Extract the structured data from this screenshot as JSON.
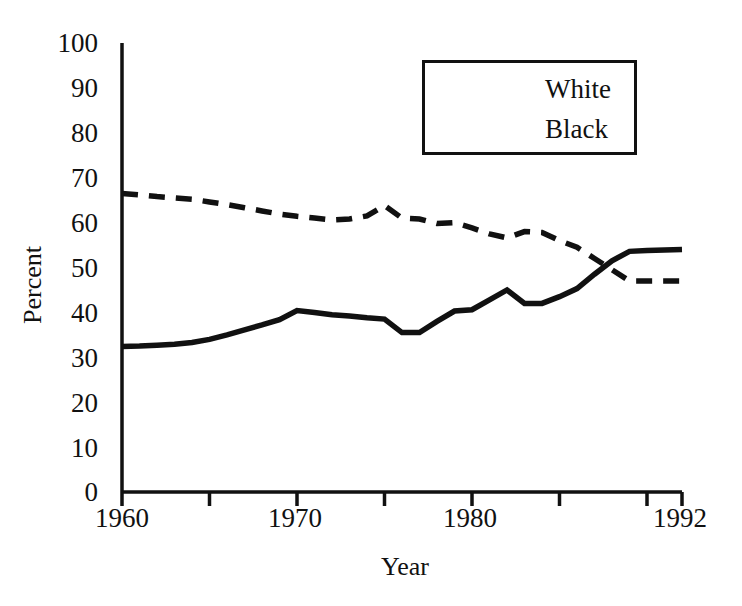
{
  "chart_data": {
    "type": "line",
    "title": "",
    "xlabel": "Year",
    "ylabel": "Percent",
    "xlim": [
      1960,
      1992
    ],
    "ylim": [
      0,
      100
    ],
    "grid": false,
    "legend_position": "top-right",
    "x_ticks_labeled": [
      "1960",
      "1970",
      "1980",
      "1992"
    ],
    "x_tick_values_labeled": [
      1960,
      1970,
      1980,
      1992
    ],
    "x_ticks_minor": [
      1965,
      1975,
      1985,
      1990
    ],
    "y_ticks": [
      "0",
      "10",
      "20",
      "30",
      "40",
      "50",
      "60",
      "70",
      "80",
      "90",
      "100"
    ],
    "y_tick_values": [
      0,
      10,
      20,
      30,
      40,
      50,
      60,
      70,
      80,
      90,
      100
    ],
    "x": [
      1960,
      1961,
      1962,
      1963,
      1964,
      1965,
      1966,
      1967,
      1968,
      1969,
      1970,
      1971,
      1972,
      1973,
      1974,
      1975,
      1976,
      1977,
      1978,
      1979,
      1980,
      1981,
      1982,
      1983,
      1984,
      1985,
      1986,
      1987,
      1988,
      1989,
      1990,
      1991,
      1992
    ],
    "series": [
      {
        "name": "White",
        "style": "dashed",
        "color": "#111111",
        "values": [
          66.5,
          66.2,
          65.8,
          65.5,
          65.2,
          64.6,
          64.0,
          63.3,
          62.6,
          61.9,
          61.4,
          61.0,
          60.6,
          60.8,
          61.5,
          63.8,
          61.0,
          60.8,
          59.8,
          60.0,
          58.8,
          57.5,
          56.6,
          58.0,
          57.8,
          56.0,
          54.5,
          52.0,
          49.5,
          47.0,
          47.0,
          47.0,
          47.0
        ]
      },
      {
        "name": "Black",
        "style": "solid",
        "color": "#111111",
        "values": [
          32.4,
          32.5,
          32.7,
          32.9,
          33.3,
          34.0,
          35.0,
          36.1,
          37.2,
          38.4,
          40.4,
          40.0,
          39.5,
          39.2,
          38.8,
          38.5,
          35.5,
          35.5,
          38.0,
          40.3,
          40.6,
          42.8,
          45.0,
          42.0,
          42.0,
          43.5,
          45.3,
          48.5,
          51.5,
          53.6,
          53.8,
          53.9,
          54.0
        ]
      }
    ],
    "notes": {
      "crossover_year": 1988,
      "white_start": 66.5,
      "white_end": 47.0,
      "black_start": 32.4,
      "black_end": 54.0
    }
  },
  "legend": {
    "entries": [
      {
        "label": "White",
        "style": "dashed"
      },
      {
        "label": "Black",
        "style": "solid"
      }
    ]
  },
  "axis": {
    "y_label": "Percent",
    "x_label": "Year"
  },
  "y_labels": {
    "t100": "100",
    "t90": "90",
    "t80": "80",
    "t70": "70",
    "t60": "60",
    "t50": "50",
    "t40": "40",
    "t30": "30",
    "t20": "20",
    "t10": "10",
    "t0": "0"
  },
  "x_labels": {
    "t1960": "1960",
    "t1970": "1970",
    "t1980": "1980",
    "t1992": "1992"
  }
}
